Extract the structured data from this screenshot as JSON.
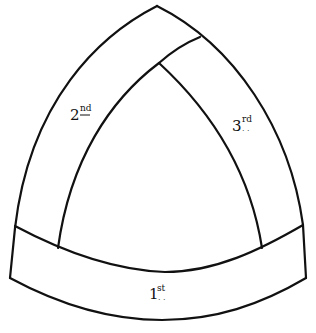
{
  "diagram": {
    "type": "vault-rib-sequence",
    "colors": {
      "ink": "#111111",
      "paper": "#ffffff"
    },
    "labels": {
      "first": {
        "number": "1",
        "suffix": "st"
      },
      "second": {
        "number": "2",
        "suffix": "nd"
      },
      "third": {
        "number": "3",
        "suffix": "rd"
      }
    }
  }
}
